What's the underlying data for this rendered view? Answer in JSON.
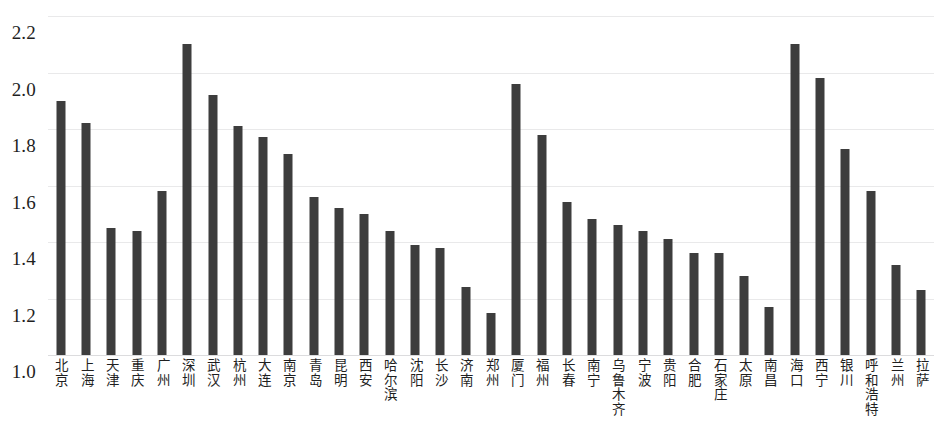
{
  "chart_data": {
    "type": "bar",
    "title": "",
    "subtitle": "",
    "xlabel": "",
    "ylabel": "",
    "ylim": [
      1.0,
      2.2
    ],
    "y_ticks": [
      "1.0",
      "1.2",
      "1.4",
      "1.6",
      "1.8",
      "2.0",
      "2.2"
    ],
    "y_tick_values": [
      1.0,
      1.2,
      1.4,
      1.6,
      1.8,
      2.0,
      2.2
    ],
    "grid": true,
    "legend": false,
    "bar_color": "#3d3d3d",
    "gridline_color": "#e9e9ea",
    "categories": [
      "北京",
      "上海",
      "天津",
      "重庆",
      "广州",
      "深圳",
      "武汉",
      "杭州",
      "大连",
      "南京",
      "青岛",
      "昆明",
      "西安",
      "哈尔滨",
      "沈阳",
      "长沙",
      "济南",
      "郑州",
      "厦门",
      "福州",
      "长春",
      "南宁",
      "乌鲁木齐",
      "宁波",
      "贵阳",
      "合肥",
      "石家庄",
      "太原",
      "南昌",
      "海口",
      "西宁",
      "银川",
      "呼和浩特",
      "兰州",
      "拉萨"
    ],
    "values": [
      1.9,
      1.82,
      1.45,
      1.44,
      1.58,
      2.1,
      1.92,
      1.81,
      1.77,
      1.71,
      1.56,
      1.52,
      1.5,
      1.44,
      1.39,
      1.38,
      1.24,
      1.15,
      1.96,
      1.78,
      1.54,
      1.48,
      1.46,
      1.44,
      1.41,
      1.36,
      1.36,
      1.28,
      1.17,
      2.1,
      1.98,
      1.73,
      1.58,
      1.32,
      1.23
    ]
  }
}
